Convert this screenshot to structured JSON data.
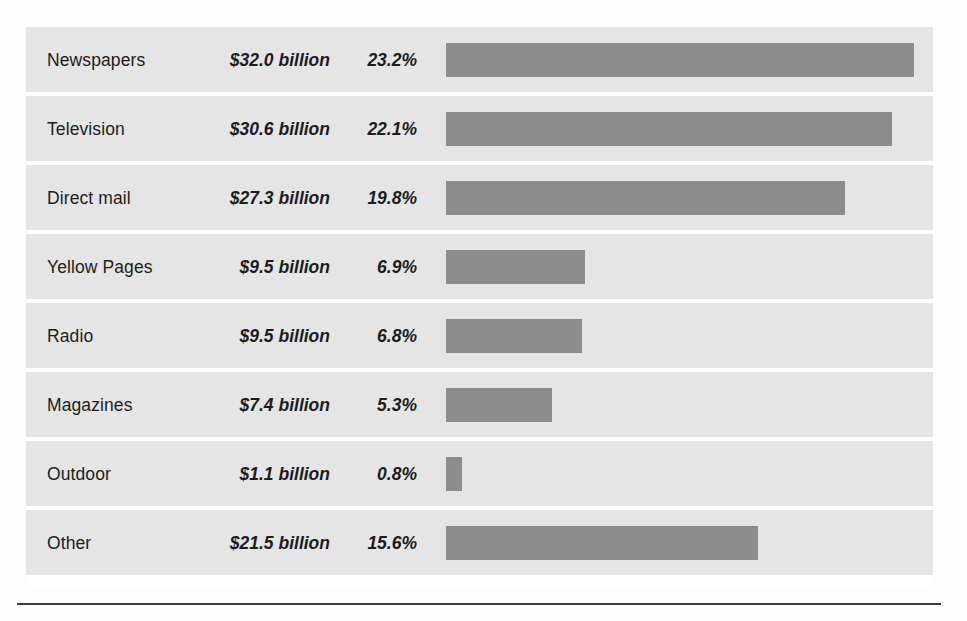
{
  "chart_data": {
    "type": "bar",
    "title": "",
    "xlabel": "",
    "ylabel": "",
    "orientation": "horizontal",
    "grid": false,
    "legend": false,
    "columns": [
      "Medium",
      "Spending",
      "Share"
    ],
    "categories": [
      "Newspapers",
      "Television",
      "Direct mail",
      "Yellow Pages",
      "Radio",
      "Magazines",
      "Outdoor",
      "Other"
    ],
    "values": [
      23.2,
      22.1,
      19.8,
      6.9,
      6.8,
      5.3,
      0.8,
      15.6
    ],
    "amounts": [
      32.0,
      30.6,
      27.3,
      9.5,
      9.5,
      7.4,
      1.1,
      21.5
    ],
    "xlim": [
      0,
      23.2
    ],
    "rows": [
      {
        "label": "Newspapers",
        "amount": "$32.0 billion",
        "percent": "23.2%",
        "value": 23.2,
        "bar_pct": 100.0
      },
      {
        "label": "Television",
        "amount": "$30.6 billion",
        "percent": "22.1%",
        "value": 22.1,
        "bar_pct": 95.3
      },
      {
        "label": "Direct mail",
        "amount": "$27.3 billion",
        "percent": "19.8%",
        "value": 19.8,
        "bar_pct": 85.3
      },
      {
        "label": "Yellow Pages",
        "amount": "$9.5 billion",
        "percent": "6.9%",
        "value": 6.9,
        "bar_pct": 29.7
      },
      {
        "label": "Radio",
        "amount": "$9.5 billion",
        "percent": "6.8%",
        "value": 6.8,
        "bar_pct": 29.0
      },
      {
        "label": "Magazines",
        "amount": "$7.4 billion",
        "percent": "5.3%",
        "value": 5.3,
        "bar_pct": 22.6
      },
      {
        "label": "Outdoor",
        "amount": "$1.1 billion",
        "percent": "0.8%",
        "value": 0.8,
        "bar_pct": 3.5
      },
      {
        "label": "Other",
        "amount": "$21.5 billion",
        "percent": "15.6%",
        "value": 15.6,
        "bar_pct": 66.7
      }
    ]
  },
  "colors": {
    "bar": "#8c8c8c",
    "row_background": "#e5e5e5",
    "page_background": "#ffffff",
    "text": "#1c1c1c",
    "rule": "#3a3a3a"
  }
}
